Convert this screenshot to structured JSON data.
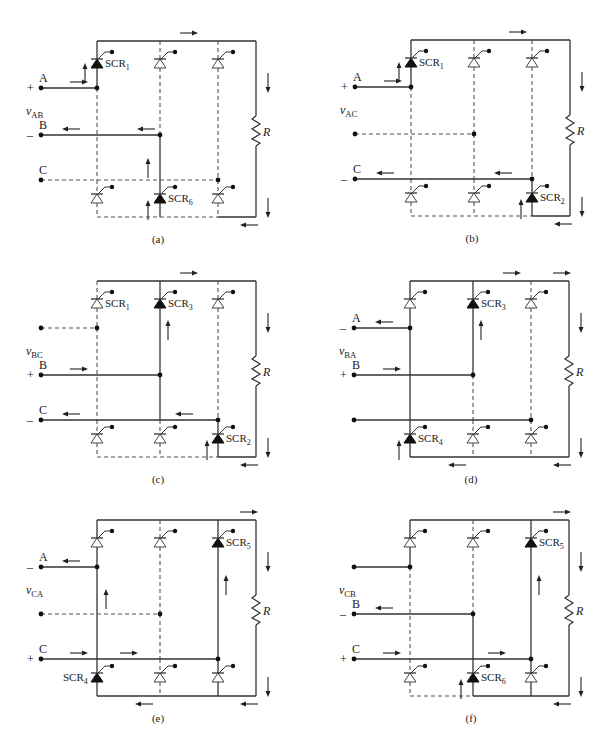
{
  "figure": {
    "resistor_label": "R",
    "colors": {
      "ink": "#1a1a1a",
      "wire": "#333333",
      "dashed": "#555555",
      "background": "#ffffff"
    },
    "panels": [
      {
        "id": "a",
        "caption": "(a)",
        "offset": [
          0,
          0
        ],
        "voltage_label": "v",
        "voltage_sub": "AB",
        "rows": [
          {
            "y": 88,
            "letter": "A",
            "sign": "+",
            "to_col": 0,
            "solid": true,
            "arrows": [
              {
                "x": 70,
                "dir": "right"
              }
            ]
          },
          {
            "y": 135,
            "letter": "B",
            "sign": "-",
            "to_col": 1,
            "solid": true,
            "arrows": [
              {
                "x": 62,
                "dir": "left"
              },
              {
                "x": 137,
                "dir": "left"
              }
            ]
          },
          {
            "y": 180,
            "letter": "C",
            "sign": "",
            "to_col": 2,
            "solid": false,
            "arrows": []
          }
        ],
        "columns": [
          {
            "upper_solid": true,
            "lower_solid": false,
            "top_on": true,
            "bottom_on": false
          },
          {
            "upper_solid": false,
            "lower_solid": true,
            "top_on": false,
            "bottom_on": true
          },
          {
            "upper_solid": false,
            "lower_solid": false,
            "top_on": false,
            "bottom_on": false
          }
        ],
        "mid_segment_solid": [
          false,
          true,
          false
        ],
        "bottom_rail_solid": [
          false,
          false,
          true
        ],
        "top_rail_solid": [
          true,
          true,
          true
        ],
        "scr_labels": [
          {
            "text": "SCR",
            "sub": "1",
            "col": 0,
            "pos": "top"
          },
          {
            "text": "SCR",
            "sub": "6",
            "col": 1,
            "pos": "bottom"
          }
        ],
        "vertical_arrows": [
          {
            "x": 85,
            "y": 63,
            "dir": "up"
          },
          {
            "x": 148,
            "y": 158,
            "dir": "up"
          },
          {
            "x": 148,
            "y": 200,
            "dir": "up"
          }
        ],
        "top_arrows": [
          {
            "x": 180,
            "dir": "right"
          }
        ],
        "bottom_arrows": [
          {
            "x": 240,
            "dir": "left"
          }
        ],
        "load_arrows": [
          {
            "y": 73
          },
          {
            "y": 198
          }
        ]
      },
      {
        "id": "b",
        "caption": "(b)",
        "offset": [
          314,
          -1
        ],
        "voltage_label": "v",
        "voltage_sub": "AC",
        "rows": [
          {
            "y": 88,
            "letter": "A",
            "sign": "+",
            "to_col": 0,
            "solid": true,
            "arrows": [
              {
                "x": 70,
                "dir": "right"
              }
            ]
          },
          {
            "y": 135,
            "letter": "",
            "sign": "",
            "to_col": 1,
            "solid": false,
            "arrows": []
          },
          {
            "y": 180,
            "letter": "C",
            "sign": "-",
            "to_col": 2,
            "solid": true,
            "arrows": [
              {
                "x": 62,
                "dir": "left"
              },
              {
                "x": 180,
                "dir": "left"
              }
            ]
          }
        ],
        "columns": [
          {
            "upper_solid": true,
            "lower_solid": false,
            "top_on": true,
            "bottom_on": false
          },
          {
            "upper_solid": false,
            "lower_solid": false,
            "top_on": false,
            "bottom_on": false
          },
          {
            "upper_solid": false,
            "lower_solid": true,
            "top_on": false,
            "bottom_on": true
          }
        ],
        "mid_segment_solid": [
          false,
          false,
          false
        ],
        "bottom_rail_solid": [
          false,
          false,
          true
        ],
        "top_rail_solid": [
          true,
          true,
          true
        ],
        "scr_labels": [
          {
            "text": "SCR",
            "sub": "1",
            "col": 0,
            "pos": "top"
          },
          {
            "text": "SCR",
            "sub": "2",
            "col": 2,
            "pos": "bottom"
          }
        ],
        "vertical_arrows": [
          {
            "x": 85,
            "y": 63,
            "dir": "up"
          },
          {
            "x": 207,
            "y": 200,
            "dir": "up"
          }
        ],
        "top_arrows": [
          {
            "x": 195,
            "dir": "right"
          }
        ],
        "bottom_arrows": [
          {
            "x": 240,
            "dir": "left"
          }
        ],
        "load_arrows": [
          {
            "y": 73
          },
          {
            "y": 198
          }
        ]
      },
      {
        "id": "c",
        "caption": "(c)",
        "offset": [
          0,
          240
        ],
        "voltage_label": "v",
        "voltage_sub": "BC",
        "rows": [
          {
            "y": 88,
            "letter": "",
            "sign": "",
            "to_col": 0,
            "solid": false,
            "arrows": []
          },
          {
            "y": 135,
            "letter": "B",
            "sign": "+",
            "to_col": 1,
            "solid": true,
            "arrows": [
              {
                "x": 70,
                "dir": "right"
              }
            ]
          },
          {
            "y": 180,
            "letter": "C",
            "sign": "-",
            "to_col": 2,
            "solid": true,
            "arrows": [
              {
                "x": 62,
                "dir": "left"
              },
              {
                "x": 175,
                "dir": "left"
              }
            ]
          }
        ],
        "columns": [
          {
            "upper_solid": false,
            "lower_solid": false,
            "top_on": false,
            "bottom_on": false
          },
          {
            "upper_solid": true,
            "lower_solid": false,
            "top_on": true,
            "bottom_on": false
          },
          {
            "upper_solid": false,
            "lower_solid": true,
            "top_on": false,
            "bottom_on": true
          }
        ],
        "mid_segment_solid": [
          false,
          true,
          false
        ],
        "bottom_rail_solid": [
          false,
          false,
          true
        ],
        "top_rail_solid": [
          true,
          true,
          true
        ],
        "scr_labels": [
          {
            "text": "SCR",
            "sub": "1",
            "col": 0,
            "pos": "top"
          },
          {
            "text": "SCR",
            "sub": "3",
            "col": 1,
            "pos": "top"
          },
          {
            "text": "SCR",
            "sub": "2",
            "col": 2,
            "pos": "bottom"
          }
        ],
        "vertical_arrows": [
          {
            "x": 168,
            "y": 80,
            "dir": "up"
          },
          {
            "x": 207,
            "y": 200,
            "dir": "up"
          }
        ],
        "top_arrows": [
          {
            "x": 180,
            "dir": "right"
          }
        ],
        "bottom_arrows": [
          {
            "x": 240,
            "dir": "left"
          }
        ],
        "load_arrows": [
          {
            "y": 73
          },
          {
            "y": 198
          }
        ]
      },
      {
        "id": "d",
        "caption": "(d)",
        "offset": [
          313,
          240
        ],
        "voltage_label": "v",
        "voltage_sub": "BA",
        "rows": [
          {
            "y": 88,
            "letter": "A",
            "sign": "-",
            "to_col": 0,
            "solid": true,
            "arrows": [
              {
                "x": 62,
                "dir": "left"
              }
            ]
          },
          {
            "y": 135,
            "letter": "B",
            "sign": "+",
            "to_col": 1,
            "solid": true,
            "arrows": [
              {
                "x": 70,
                "dir": "right"
              }
            ]
          },
          {
            "y": 180,
            "letter": "",
            "sign": "",
            "to_col": 2,
            "solid": true,
            "arrows": []
          }
        ],
        "columns": [
          {
            "upper_solid": true,
            "lower_solid": true,
            "top_on": false,
            "bottom_on": true
          },
          {
            "upper_solid": true,
            "lower_solid": false,
            "top_on": true,
            "bottom_on": false
          },
          {
            "upper_solid": false,
            "lower_solid": false,
            "top_on": false,
            "bottom_on": false
          }
        ],
        "mid_segment_solid": [
          true,
          false,
          false
        ],
        "bottom_rail_solid": [
          true,
          true,
          true
        ],
        "top_rail_solid": [
          true,
          true,
          true
        ],
        "scr_labels": [
          {
            "text": "SCR",
            "sub": "3",
            "col": 1,
            "pos": "top"
          },
          {
            "text": "SCR",
            "sub": "4",
            "col": 0,
            "pos": "bottom"
          }
        ],
        "vertical_arrows": [
          {
            "x": 168,
            "y": 80,
            "dir": "up"
          },
          {
            "x": 86,
            "y": 200,
            "dir": "up"
          }
        ],
        "top_arrows": [
          {
            "x": 190,
            "dir": "right"
          },
          {
            "x": 240,
            "dir": "right"
          }
        ],
        "bottom_arrows": [
          {
            "x": 135,
            "dir": "left"
          },
          {
            "x": 240,
            "dir": "left"
          }
        ],
        "load_arrows": [
          {
            "y": 73
          },
          {
            "y": 198
          }
        ]
      },
      {
        "id": "e",
        "caption": "(e)",
        "offset": [
          0,
          479
        ],
        "voltage_label": "v",
        "voltage_sub": "CA",
        "rows": [
          {
            "y": 88,
            "letter": "A",
            "sign": "-",
            "to_col": 0,
            "solid": true,
            "arrows": [
              {
                "x": 62,
                "dir": "left"
              }
            ]
          },
          {
            "y": 135,
            "letter": "",
            "sign": "",
            "to_col": 1,
            "solid": false,
            "arrows": []
          },
          {
            "y": 180,
            "letter": "C",
            "sign": "+",
            "to_col": 2,
            "solid": true,
            "arrows": [
              {
                "x": 70,
                "dir": "right"
              },
              {
                "x": 120,
                "dir": "right"
              }
            ]
          }
        ],
        "columns": [
          {
            "upper_solid": true,
            "lower_solid": true,
            "top_on": false,
            "bottom_on": true
          },
          {
            "upper_solid": false,
            "lower_solid": false,
            "top_on": false,
            "bottom_on": false
          },
          {
            "upper_solid": true,
            "lower_solid": true,
            "top_on": true,
            "bottom_on": false
          }
        ],
        "mid_segment_solid": [
          true,
          false,
          true
        ],
        "bottom_rail_solid": [
          true,
          true,
          true
        ],
        "top_rail_solid": [
          true,
          true,
          true
        ],
        "scr_labels": [
          {
            "text": "SCR",
            "sub": "5",
            "col": 2,
            "pos": "top"
          },
          {
            "text": "SCR",
            "sub": "4",
            "col": 0,
            "pos": "bottom-left"
          }
        ],
        "vertical_arrows": [
          {
            "x": 106,
            "y": 110,
            "dir": "up"
          },
          {
            "x": 226,
            "y": 96,
            "dir": "up"
          }
        ],
        "top_arrows": [
          {
            "x": 240,
            "dir": "right"
          }
        ],
        "bottom_arrows": [
          {
            "x": 135,
            "dir": "left"
          },
          {
            "x": 240,
            "dir": "left"
          }
        ],
        "load_arrows": [
          {
            "y": 73
          },
          {
            "y": 198
          }
        ]
      },
      {
        "id": "f",
        "caption": "(f)",
        "offset": [
          313,
          479
        ],
        "voltage_label": "v",
        "voltage_sub": "CB",
        "rows": [
          {
            "y": 88,
            "letter": "",
            "sign": "",
            "to_col": 0,
            "solid": true,
            "arrows": []
          },
          {
            "y": 135,
            "letter": "B",
            "sign": "-",
            "to_col": 1,
            "solid": true,
            "arrows": [
              {
                "x": 62,
                "dir": "left"
              }
            ]
          },
          {
            "y": 180,
            "letter": "C",
            "sign": "+",
            "to_col": 2,
            "solid": true,
            "arrows": [
              {
                "x": 70,
                "dir": "right"
              },
              {
                "x": 175,
                "dir": "right"
              }
            ]
          }
        ],
        "columns": [
          {
            "upper_solid": true,
            "lower_solid": false,
            "top_on": false,
            "bottom_on": false
          },
          {
            "upper_solid": false,
            "lower_solid": true,
            "top_on": false,
            "bottom_on": true
          },
          {
            "upper_solid": true,
            "lower_solid": true,
            "top_on": true,
            "bottom_on": false
          }
        ],
        "mid_segment_solid": [
          false,
          true,
          true
        ],
        "bottom_rail_solid": [
          false,
          true,
          true
        ],
        "top_rail_solid": [
          true,
          true,
          true
        ],
        "scr_labels": [
          {
            "text": "SCR",
            "sub": "5",
            "col": 2,
            "pos": "top"
          },
          {
            "text": "SCR",
            "sub": "6",
            "col": 1,
            "pos": "bottom"
          }
        ],
        "vertical_arrows": [
          {
            "x": 226,
            "y": 96,
            "dir": "up"
          },
          {
            "x": 148,
            "y": 200,
            "dir": "up"
          }
        ],
        "top_arrows": [
          {
            "x": 240,
            "dir": "right"
          }
        ],
        "bottom_arrows": [
          {
            "x": 240,
            "dir": "left"
          }
        ],
        "load_arrows": [
          {
            "y": 73
          },
          {
            "y": 198
          }
        ]
      }
    ]
  }
}
